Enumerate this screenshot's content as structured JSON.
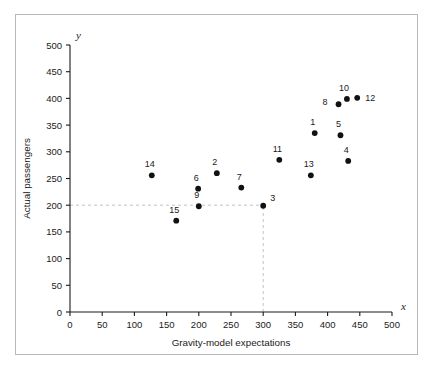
{
  "figure": {
    "border_color": "#b8b8b8",
    "background": "#ffffff"
  },
  "chart_data": {
    "type": "scatter",
    "title": "",
    "xlabel": "Gravity-model expectations",
    "ylabel": "Actual passengers",
    "x_axis_symbol": "x",
    "y_axis_symbol": "y",
    "xlim": [
      0,
      500
    ],
    "ylim": [
      0,
      500
    ],
    "xticks": [
      0,
      50,
      100,
      150,
      200,
      250,
      300,
      350,
      400,
      450,
      500
    ],
    "yticks": [
      0,
      50,
      100,
      150,
      200,
      250,
      300,
      350,
      400,
      450,
      500
    ],
    "xticklabels": [
      "0",
      "50",
      "100",
      "150",
      "200",
      "250",
      "300",
      "350",
      "400",
      "450",
      "500"
    ],
    "yticklabels": [
      "0",
      "50",
      "100",
      "150",
      "200",
      "250",
      "300",
      "350",
      "400",
      "450",
      "500"
    ],
    "grid": false,
    "legend": null,
    "marker_color": "#111111",
    "guides": [
      {
        "name": "horizontal-reference-y200",
        "orientation": "horizontal",
        "value": 200,
        "from": 0,
        "to": 300,
        "style": "dashed",
        "color": "#c2c2c2"
      },
      {
        "name": "vertical-reference-x300",
        "orientation": "vertical",
        "value": 300,
        "from": 0,
        "to": 200,
        "style": "dashed",
        "color": "#c2c2c2"
      }
    ],
    "points": [
      {
        "label": "1",
        "x": 380,
        "y": 335,
        "label_dx": -2,
        "label_dy": -8
      },
      {
        "label": "2",
        "x": 228,
        "y": 260,
        "label_dx": -2,
        "label_dy": -8
      },
      {
        "label": "3",
        "x": 300,
        "y": 199,
        "label_dx": 7,
        "label_dy": -5
      },
      {
        "label": "4",
        "x": 432,
        "y": 283,
        "label_dx": -2,
        "label_dy": -8
      },
      {
        "label": "5",
        "x": 420,
        "y": 331,
        "label_dx": -2,
        "label_dy": -8
      },
      {
        "label": "6",
        "x": 199,
        "y": 231,
        "label_dx": -2,
        "label_dy": -8
      },
      {
        "label": "7",
        "x": 266,
        "y": 233,
        "label_dx": -2,
        "label_dy": -8
      },
      {
        "label": "8",
        "x": 417,
        "y": 389,
        "label_dx": -11,
        "label_dy": 1
      },
      {
        "label": "9",
        "x": 200,
        "y": 198,
        "label_dx": -2,
        "label_dy": -8
      },
      {
        "label": "10",
        "x": 430,
        "y": 399,
        "label_dx": -3,
        "label_dy": -8
      },
      {
        "label": "11",
        "x": 325,
        "y": 285,
        "label_dx": -2,
        "label_dy": -8
      },
      {
        "label": "12",
        "x": 446,
        "y": 401,
        "label_dx": 8,
        "label_dy": 3
      },
      {
        "label": "13",
        "x": 374,
        "y": 256,
        "label_dx": -2,
        "label_dy": -8
      },
      {
        "label": "14",
        "x": 127,
        "y": 256,
        "label_dx": -2,
        "label_dy": -8
      },
      {
        "label": "15",
        "x": 165,
        "y": 171,
        "label_dx": -2,
        "label_dy": -8
      }
    ]
  }
}
